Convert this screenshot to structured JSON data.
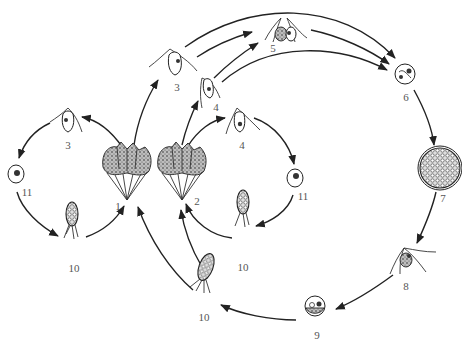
{
  "diagram": {
    "type": "life-cycle",
    "style": "black-and-white line drawing",
    "colors": {
      "line": "#222222",
      "label": "#555555",
      "background": "#ffffff"
    },
    "nodes": [
      {
        "id": "n1",
        "label": "1",
        "kind": "colony (fan-shaped, stippled)",
        "x": 127,
        "y": 200
      },
      {
        "id": "n2",
        "label": "2",
        "kind": "colony (fan-shaped, stippled)",
        "x": 188,
        "y": 200
      },
      {
        "id": "n3a",
        "label": "3",
        "kind": "biflagellate cell",
        "x": 68,
        "y": 125
      },
      {
        "id": "n3b",
        "label": "3",
        "kind": "biflagellate cell",
        "x": 175,
        "y": 65
      },
      {
        "id": "n4a",
        "label": "4",
        "kind": "biflagellate cell",
        "x": 210,
        "y": 90
      },
      {
        "id": "n4b",
        "label": "4",
        "kind": "biflagellate cell",
        "x": 240,
        "y": 125
      },
      {
        "id": "n5",
        "label": "5",
        "kind": "paired fusing cells",
        "x": 285,
        "y": 30
      },
      {
        "id": "n6",
        "label": "6",
        "kind": "zygote",
        "x": 405,
        "y": 75
      },
      {
        "id": "n7",
        "label": "7",
        "kind": "cyst with many cells",
        "x": 440,
        "y": 175
      },
      {
        "id": "n8",
        "label": "8",
        "kind": "multiflagellate cell",
        "x": 408,
        "y": 265
      },
      {
        "id": "n9",
        "label": "9",
        "kind": "round cell",
        "x": 315,
        "y": 320
      },
      {
        "id": "n10a",
        "label": "10",
        "kind": "germling",
        "x": 72,
        "y": 240
      },
      {
        "id": "n10b",
        "label": "10",
        "kind": "germling",
        "x": 243,
        "y": 225
      },
      {
        "id": "n10c",
        "label": "10",
        "kind": "germling",
        "x": 203,
        "y": 290
      },
      {
        "id": "n11a",
        "label": "11",
        "kind": "encysted cell",
        "x": 16,
        "y": 170
      },
      {
        "id": "n11b",
        "label": "11",
        "kind": "encysted cell",
        "x": 295,
        "y": 180
      }
    ],
    "edges": [
      {
        "from": "n1",
        "to": "n3a"
      },
      {
        "from": "n3a",
        "to": "n11a"
      },
      {
        "from": "n11a",
        "to": "n10a"
      },
      {
        "from": "n10a",
        "to": "n1"
      },
      {
        "from": "n1",
        "to": "n3b"
      },
      {
        "from": "n2",
        "to": "n4a"
      },
      {
        "from": "n2",
        "to": "n4b"
      },
      {
        "from": "n4b",
        "to": "n11b"
      },
      {
        "from": "n11b",
        "to": "n10b"
      },
      {
        "from": "n10b",
        "to": "n2"
      },
      {
        "from": "n3b",
        "to": "n5"
      },
      {
        "from": "n4a",
        "to": "n5"
      },
      {
        "from": "n3b",
        "to": "n6"
      },
      {
        "from": "n4a",
        "to": "n6"
      },
      {
        "from": "n5",
        "to": "n6"
      },
      {
        "from": "n6",
        "to": "n7"
      },
      {
        "from": "n7",
        "to": "n8"
      },
      {
        "from": "n8",
        "to": "n9"
      },
      {
        "from": "n9",
        "to": "n10c"
      },
      {
        "from": "n10c",
        "to": "n1"
      },
      {
        "from": "n10c",
        "to": "n2"
      }
    ]
  },
  "labels": {
    "n1": "1",
    "n2": "2",
    "n3a": "3",
    "n3b": "3",
    "n4a": "4",
    "n4b": "4",
    "n5": "5",
    "n6": "6",
    "n7": "7",
    "n8": "8",
    "n9": "9",
    "n10a": "10",
    "n10b": "10",
    "n10c": "10",
    "n11a": "11",
    "n11b": "11"
  }
}
